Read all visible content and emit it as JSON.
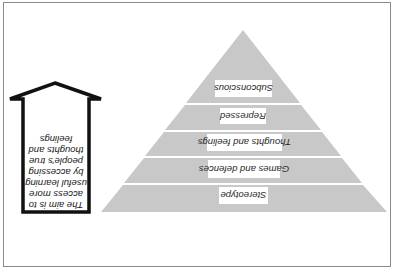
{
  "diagram": {
    "orientation": "rotated-180",
    "pyramid": {
      "fill": "#c8c8c8",
      "gap_color": "#ffffff",
      "layers": [
        {
          "label": "Subconscious"
        },
        {
          "label": "Repressed"
        },
        {
          "label": "Thoughts and feelings"
        },
        {
          "label": "Games and defences"
        },
        {
          "label": "Stereotype"
        }
      ]
    },
    "arrow": {
      "stroke": "#111111",
      "lines": [
        "The aim is to",
        "access more",
        "useful learning",
        "by accessing",
        "people's true",
        "thoughts and",
        "feelings"
      ]
    }
  }
}
